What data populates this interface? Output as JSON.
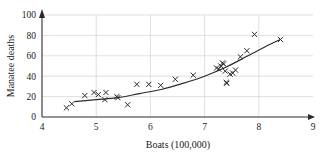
{
  "chart_data": {
    "type": "scatter",
    "title": "",
    "xlabel": "Boats (100,000)",
    "ylabel": "Manatee deaths",
    "xlim": [
      4,
      9
    ],
    "ylim": [
      0,
      100
    ],
    "xticks": [
      4,
      5,
      6,
      7,
      8,
      9
    ],
    "yticks": [
      0,
      20,
      40,
      60,
      80,
      100
    ],
    "xtick_labels": [
      "4",
      "5",
      "6",
      "7",
      "8",
      "9"
    ],
    "ytick_labels": [
      "0",
      "20",
      "40",
      "60",
      "80",
      "100"
    ],
    "grid": "both-major",
    "legend": "none",
    "marker": "x",
    "marker_color": "#2b2b2b",
    "axis_color": "#2b2b2b",
    "grid_color": "#c9c9c9",
    "points": [
      {
        "x": 4.45,
        "y": 9
      },
      {
        "x": 4.55,
        "y": 13
      },
      {
        "x": 4.79,
        "y": 21
      },
      {
        "x": 4.96,
        "y": 24
      },
      {
        "x": 5.04,
        "y": 22
      },
      {
        "x": 5.16,
        "y": 17
      },
      {
        "x": 5.18,
        "y": 24
      },
      {
        "x": 5.38,
        "y": 20
      },
      {
        "x": 5.4,
        "y": 19
      },
      {
        "x": 5.58,
        "y": 12
      },
      {
        "x": 5.75,
        "y": 32
      },
      {
        "x": 5.97,
        "y": 32
      },
      {
        "x": 6.19,
        "y": 31
      },
      {
        "x": 6.46,
        "y": 37
      },
      {
        "x": 6.79,
        "y": 41
      },
      {
        "x": 7.22,
        "y": 48
      },
      {
        "x": 7.26,
        "y": 47
      },
      {
        "x": 7.3,
        "y": 50
      },
      {
        "x": 7.33,
        "y": 53
      },
      {
        "x": 7.35,
        "y": 52
      },
      {
        "x": 7.38,
        "y": 45
      },
      {
        "x": 7.4,
        "y": 34
      },
      {
        "x": 7.41,
        "y": 33
      },
      {
        "x": 7.47,
        "y": 42
      },
      {
        "x": 7.52,
        "y": 43
      },
      {
        "x": 7.57,
        "y": 46
      },
      {
        "x": 7.66,
        "y": 59
      },
      {
        "x": 7.78,
        "y": 65
      },
      {
        "x": 7.92,
        "y": 81
      },
      {
        "x": 8.4,
        "y": 76
      }
    ],
    "fit_curve": {
      "description": "smooth increasing exponential-like trend curve",
      "points": [
        {
          "x": 4.6,
          "y": 15
        },
        {
          "x": 5.0,
          "y": 17
        },
        {
          "x": 5.4,
          "y": 19
        },
        {
          "x": 5.8,
          "y": 23
        },
        {
          "x": 6.2,
          "y": 27
        },
        {
          "x": 6.6,
          "y": 33
        },
        {
          "x": 7.0,
          "y": 40
        },
        {
          "x": 7.4,
          "y": 49
        },
        {
          "x": 7.8,
          "y": 60
        },
        {
          "x": 8.2,
          "y": 71
        },
        {
          "x": 8.4,
          "y": 76
        }
      ]
    }
  }
}
